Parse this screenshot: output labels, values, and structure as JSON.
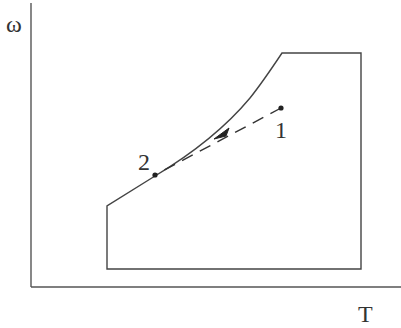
{
  "diagram": {
    "type": "psychrometric-region",
    "axes": {
      "y_label": "ω",
      "x_label": "T"
    },
    "points": [
      {
        "id": "1",
        "label": "1"
      },
      {
        "id": "2",
        "label": "2"
      }
    ],
    "process": {
      "from": "1",
      "to": "2",
      "style": "dashed-arrow"
    },
    "colors": {
      "line": "#444444",
      "background": "#ffffff"
    }
  }
}
